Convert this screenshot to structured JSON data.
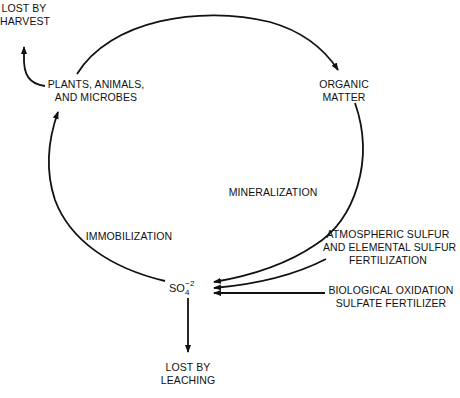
{
  "diagram": {
    "nodes": {
      "lost_by_harvest": {
        "lines": [
          "LOST BY",
          "HARVEST"
        ]
      },
      "plants": {
        "lines": [
          "PLANTS, ANIMALS,",
          "AND MICROBES"
        ]
      },
      "organic_matter": {
        "lines": [
          "ORGANIC",
          "MATTER"
        ]
      },
      "sulfate": {
        "base": "SO",
        "subscript": "4",
        "superscript": "−2"
      },
      "lost_by_leaching": {
        "lines": [
          "LOST BY",
          "LEACHING"
        ]
      },
      "atmospheric": {
        "lines": [
          "ATMOSPHERIC SULFUR",
          "AND ELEMENTAL SULFUR",
          "FERTILIZATION"
        ]
      },
      "biological": {
        "lines": [
          "BIOLOGICAL OXIDATION",
          "SULFATE FERTILIZER"
        ]
      }
    },
    "processes": {
      "mineralization": "MINERALIZATION",
      "immobilization": "IMMOBILIZATION"
    },
    "edges": [
      {
        "from": "plants",
        "to": "organic_matter"
      },
      {
        "from": "organic_matter",
        "to": "sulfate",
        "label": "mineralization"
      },
      {
        "from": "sulfate",
        "to": "plants",
        "label": "immobilization"
      },
      {
        "from": "plants",
        "to": "lost_by_harvest"
      },
      {
        "from": "sulfate",
        "to": "lost_by_leaching"
      },
      {
        "from": "atmospheric",
        "to": "sulfate"
      },
      {
        "from": "biological",
        "to": "sulfate"
      }
    ],
    "colors": {
      "line": "#111111",
      "background": "#ffffff"
    }
  }
}
